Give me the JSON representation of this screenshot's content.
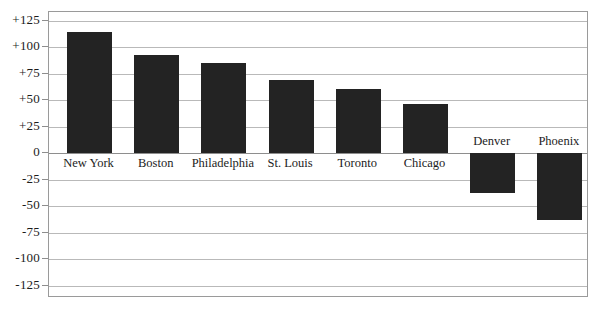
{
  "chart_data": {
    "type": "bar",
    "title": "",
    "subtitle": "",
    "xlabel": "",
    "ylabel": "",
    "categories": [
      "New York",
      "Boston",
      "Philadelphia",
      "St. Louis",
      "Toronto",
      "Chicago",
      "Denver",
      "Phoenix"
    ],
    "values": [
      115,
      93,
      85,
      69,
      61,
      47,
      -37,
      -63
    ],
    "ylim": [
      -125,
      125
    ],
    "yticks": [
      125,
      100,
      75,
      50,
      25,
      0,
      -25,
      -50,
      -75,
      -100,
      -125
    ],
    "ytick_labels": [
      "+125",
      "+100",
      "+75",
      "+50",
      "+25",
      "0",
      "-25",
      "-50",
      "-75",
      "-100",
      "-125"
    ],
    "grid": true,
    "legend": null,
    "legend_position": "none",
    "bar_color": "#232323",
    "grid_color": "#b9b9b9",
    "frame_color": "#9a9a9a",
    "background_color": "#ffffff",
    "zero_line_color": "#8e8e8e"
  }
}
